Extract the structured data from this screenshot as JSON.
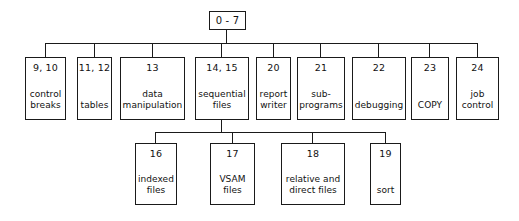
{
  "diagram": {
    "type": "tree-hierarchy",
    "title": "",
    "root": {
      "number": "0 - 7",
      "label": ""
    },
    "level1": [
      {
        "number": "9, 10",
        "label": "control\nbreaks"
      },
      {
        "number": "11, 12",
        "label": "tables"
      },
      {
        "number": "13",
        "label": "data\nmanipulation"
      },
      {
        "number": "14, 15",
        "label": "sequential\nfiles"
      },
      {
        "number": "20",
        "label": "report\nwriter"
      },
      {
        "number": "21",
        "label": "sub-\nprograms"
      },
      {
        "number": "22",
        "label": "debugging"
      },
      {
        "number": "23",
        "label": "COPY"
      },
      {
        "number": "24",
        "label": "job\ncontrol"
      }
    ],
    "level2": [
      {
        "number": "16",
        "label": "indexed\nfiles"
      },
      {
        "number": "17",
        "label": "VSAM\nfiles"
      },
      {
        "number": "18",
        "label": "relative and\ndirect files"
      },
      {
        "number": "19",
        "label": "sort"
      }
    ],
    "colors": {
      "stroke": "#1a1a1a",
      "background": "#ffffff",
      "text": "#111111"
    }
  }
}
